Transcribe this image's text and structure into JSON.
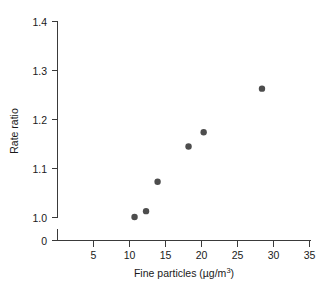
{
  "chart_data": {
    "type": "scatter",
    "title": "",
    "xlabel": "Fine particles (µg/m³)",
    "ylabel": "Rate ratio",
    "xlim": [
      0,
      35
    ],
    "ylim": [
      0.97,
      1.4
    ],
    "grid": false,
    "legend": null,
    "x_ticks": [
      5,
      10,
      15,
      20,
      25,
      30,
      35
    ],
    "x_tick_labels": [
      "5",
      "10",
      "15",
      "20",
      "25",
      "30",
      "35"
    ],
    "y_ticks": [
      0,
      1.0,
      1.1,
      1.2,
      1.3,
      1.4
    ],
    "y_tick_labels": [
      "0",
      "1.0",
      "1.1",
      "1.2",
      "1.3",
      "1.4"
    ],
    "y_axis_broken": true,
    "point_color": "#4d4d4d",
    "axis_color": "#3a3a3a",
    "marker": "filled-circle",
    "points": [
      {
        "x": 10.7,
        "y": 1.001
      },
      {
        "x": 12.3,
        "y": 1.013
      },
      {
        "x": 13.9,
        "y": 1.073
      },
      {
        "x": 18.2,
        "y": 1.145
      },
      {
        "x": 20.3,
        "y": 1.174
      },
      {
        "x": 28.4,
        "y": 1.263
      }
    ]
  },
  "axis_titles": {
    "x_main": "Fine particles (µg/m",
    "x_sup": "3",
    "x_close": ")",
    "y": "Rate ratio"
  }
}
